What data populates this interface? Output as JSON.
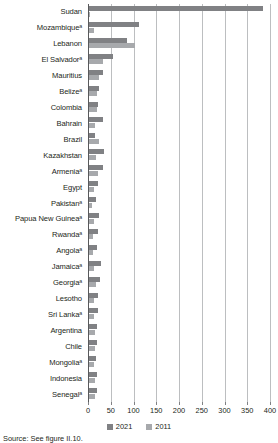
{
  "chart_data": {
    "type": "bar",
    "orientation": "horizontal",
    "title": "",
    "xlabel": "",
    "ylabel": "",
    "xlim": [
      0,
      400
    ],
    "xticks": [
      0,
      50,
      100,
      150,
      200,
      250,
      300,
      350,
      400
    ],
    "grid": true,
    "legend_position": "bottom",
    "categories": [
      "Sudan",
      "Mozambiqueᵃ",
      "Lebanon",
      "El Salvadorᵃ",
      "Mauritius",
      "Belizeᵃ",
      "Colombia",
      "Bahrain",
      "Brazil",
      "Kazakhstan",
      "Armeniaᵃ",
      "Egypt",
      "Pakistanᵃ",
      "Papua New Guineaᵃ",
      "Rwandaᵃ",
      "Angolaᵃ",
      "Jamaicaᵃ",
      "Georgiaᵃ",
      "Lesotho",
      "Sri Lankaᵃ",
      "Argentina",
      "Chile",
      "Mongoliaᵃ",
      "Indonesia",
      "Senegalᵃ"
    ],
    "series": [
      {
        "name": "2021",
        "color": "#808184",
        "values": [
          383,
          110,
          84,
          53,
          30,
          22,
          20,
          30,
          13,
          34,
          31,
          19,
          16,
          21,
          19,
          17,
          27,
          25,
          19,
          19,
          17,
          18,
          15,
          17,
          17
        ]
      },
      {
        "name": "2011",
        "color": "#a7a9ac",
        "values": [
          3,
          11,
          100,
          30,
          21,
          18,
          17,
          14,
          22,
          16,
          20,
          10,
          7,
          10,
          9,
          9,
          10,
          15,
          10,
          11,
          13,
          14,
          12,
          13,
          13
        ]
      }
    ]
  },
  "legend": {
    "items": [
      {
        "label": "2021",
        "color": "#808184"
      },
      {
        "label": "2011",
        "color": "#a7a9ac"
      }
    ]
  },
  "source_note": "Source:  See figure II.10."
}
